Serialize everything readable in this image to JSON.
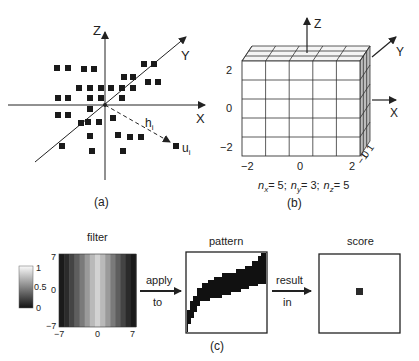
{
  "panel_a": {
    "caption": "(a)",
    "axes": {
      "x": "X",
      "y": "Y",
      "z": "Z"
    },
    "vector_label": "h",
    "vector_sub": "i",
    "point_label": "u",
    "point_sub": "i",
    "points": [
      [
        57,
        68
      ],
      [
        68,
        68
      ],
      [
        84,
        69
      ],
      [
        94,
        69
      ],
      [
        144,
        64
      ],
      [
        154,
        64
      ],
      [
        124,
        77
      ],
      [
        133,
        77
      ],
      [
        148,
        82
      ],
      [
        158,
        82
      ],
      [
        79,
        88
      ],
      [
        90,
        88
      ],
      [
        101,
        88
      ],
      [
        111,
        88
      ],
      [
        122,
        88
      ],
      [
        133,
        88
      ],
      [
        58,
        98
      ],
      [
        68,
        98
      ],
      [
        90,
        98
      ],
      [
        101,
        98
      ],
      [
        122,
        98
      ],
      [
        90,
        109
      ],
      [
        58,
        115
      ],
      [
        68,
        115
      ],
      [
        113,
        118
      ],
      [
        81,
        123
      ],
      [
        88,
        122
      ],
      [
        99,
        122
      ],
      [
        90,
        136
      ],
      [
        118,
        135
      ],
      [
        130,
        137
      ],
      [
        141,
        137
      ],
      [
        62,
        146
      ],
      [
        92,
        151
      ],
      [
        123,
        151
      ]
    ]
  },
  "panel_b": {
    "caption": "(b)",
    "axes": {
      "x": "X",
      "y": "Y",
      "z": "Z"
    },
    "x_ticks": [
      "−2",
      "0",
      "2"
    ],
    "z_ticks": [
      "2",
      "0",
      "−2"
    ],
    "y_ticks": [
      "1",
      "0",
      "−1"
    ],
    "formula": {
      "nx": "n",
      "nx_sub": "x",
      "nx_val": "= 5;",
      "ny": "n",
      "ny_sub": "y",
      "ny_val": "= 3;",
      "nz": "n",
      "nz_sub": "z",
      "nz_val": "= 5"
    },
    "grid": {
      "nx": 5,
      "ny": 3,
      "nz": 5
    }
  },
  "panel_c": {
    "caption": "(c)",
    "filter": {
      "title": "filter",
      "x_ticks": [
        "−7",
        "0",
        "7"
      ],
      "y_ticks": [
        "7",
        "0",
        "−7"
      ],
      "colorbar_ticks": [
        "1",
        "0.5",
        "0"
      ],
      "column_gray": [
        "#1a1a1a",
        "#2b2b2b",
        "#444",
        "#5e5e5e",
        "#7a7a7a",
        "#9a9a9a",
        "#b9b9b9",
        "#d2d2d2",
        "#b9b9b9",
        "#9a9a9a",
        "#7a7a7a",
        "#5e5e5e",
        "#444",
        "#2b2b2b",
        "#1a1a1a"
      ]
    },
    "arrow1": {
      "top": "apply",
      "bottom": "to"
    },
    "pattern": {
      "title": "pattern"
    },
    "arrow2": {
      "top": "result",
      "bottom": "in"
    },
    "score": {
      "title": "score"
    }
  }
}
